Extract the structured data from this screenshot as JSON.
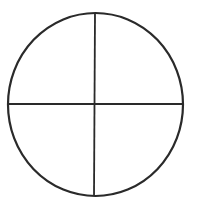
{
  "diagram": {
    "type": "circle-quadrants",
    "stroke_color": "#2a2a2a",
    "background_color": "#ffffff",
    "circle": {
      "cx": 95.5,
      "cy": 104.5,
      "rx": 87.5,
      "ry": 91.5,
      "stroke_width": 2.2
    },
    "vertical_line": {
      "x1": 95,
      "y1": 13,
      "x2": 94,
      "y2": 196,
      "stroke_width": 1.8
    },
    "horizontal_line": {
      "x1": 8,
      "y1": 104,
      "x2": 183,
      "y2": 104,
      "stroke_width": 1.8
    },
    "quadrant_count": 4
  }
}
